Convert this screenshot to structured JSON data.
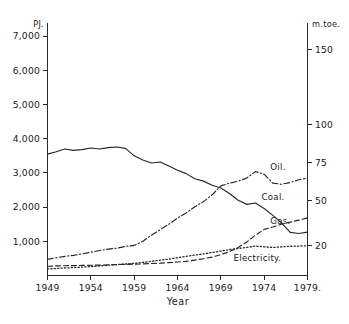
{
  "chart_data": {
    "type": "line",
    "title": "",
    "xlabel": "Year",
    "ylabel": "PJ.",
    "ylabel_right": "m.toe.",
    "grid": false,
    "legend": "inline-right-end-labels",
    "xlim": [
      1949,
      1979
    ],
    "ylim": [
      0,
      7400
    ],
    "ylim_right": [
      0,
      168
    ],
    "x_tick_labels": [
      "1949",
      "1954",
      "1959",
      "1964",
      "1969",
      "1974",
      "1979."
    ],
    "x_ticks": [
      1949,
      1954,
      1959,
      1964,
      1969,
      1974,
      1979
    ],
    "y_tick_labels": [
      "1,000",
      "2,000",
      "3,000",
      "4,000",
      "5,000",
      "6,000",
      "7,000"
    ],
    "y_ticks": [
      1000,
      2000,
      3000,
      4000,
      5000,
      6000,
      7000
    ],
    "y_right_tick_labels": [
      "20",
      "50",
      "75",
      "100",
      "150"
    ],
    "y_right_ticks": [
      20,
      50,
      75,
      100,
      150
    ],
    "x": [
      1949,
      1950,
      1951,
      1952,
      1953,
      1954,
      1955,
      1956,
      1957,
      1958,
      1959,
      1960,
      1961,
      1962,
      1963,
      1964,
      1965,
      1966,
      1967,
      1968,
      1969,
      1970,
      1971,
      1972,
      1973,
      1974,
      1975,
      1976,
      1977,
      1978,
      1979
    ],
    "series": [
      {
        "name": "Coal",
        "label": "Coal.",
        "style": "solid",
        "values": [
          3550,
          3620,
          3700,
          3660,
          3680,
          3730,
          3700,
          3740,
          3760,
          3720,
          3500,
          3380,
          3290,
          3320,
          3200,
          3080,
          2980,
          2830,
          2760,
          2640,
          2560,
          2400,
          2200,
          2080,
          2120,
          1960,
          1760,
          1540,
          1260,
          1230,
          1270
        ]
      },
      {
        "name": "Oil",
        "label": "Oil.",
        "style": "dash-dot",
        "values": [
          470,
          520,
          560,
          590,
          630,
          680,
          730,
          770,
          800,
          850,
          880,
          1000,
          1180,
          1340,
          1500,
          1680,
          1830,
          2010,
          2160,
          2360,
          2620,
          2700,
          2760,
          2850,
          3040,
          2960,
          2700,
          2670,
          2720,
          2800,
          2850
        ]
      },
      {
        "name": "Gas",
        "label": "Gas.",
        "style": "dashed",
        "values": [
          270,
          280,
          285,
          290,
          295,
          300,
          305,
          312,
          320,
          326,
          332,
          340,
          350,
          360,
          375,
          395,
          415,
          450,
          490,
          540,
          610,
          700,
          820,
          980,
          1180,
          1350,
          1420,
          1500,
          1560,
          1620,
          1680
        ]
      },
      {
        "name": "Electricity",
        "label": "Electricity.",
        "style": "dotted",
        "values": [
          190,
          205,
          220,
          232,
          245,
          262,
          280,
          300,
          320,
          336,
          355,
          385,
          415,
          448,
          480,
          520,
          560,
          600,
          630,
          672,
          715,
          760,
          790,
          820,
          860,
          840,
          820,
          840,
          855,
          862,
          870
        ]
      }
    ]
  },
  "axes": {
    "left_unit": "PJ.",
    "right_unit": "m.toe.",
    "x_title": "Year"
  }
}
